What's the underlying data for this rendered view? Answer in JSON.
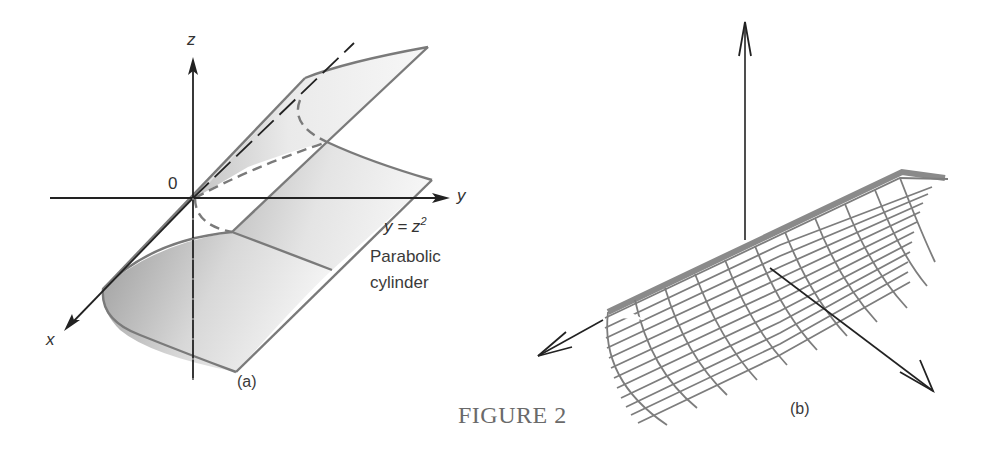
{
  "figure": {
    "title": "FIGURE 2"
  },
  "panel_a": {
    "label": "(a)",
    "axes": {
      "x_label": "x",
      "y_label": "y",
      "z_label": "z",
      "origin_label": "0"
    },
    "equation": {
      "lhs": "y = z",
      "exponent": "2"
    },
    "caption_line1": "Parabolic",
    "caption_line2": "cylinder"
  },
  "panel_b": {
    "label": "(b)"
  },
  "colors": {
    "surface_edge": "#7a7a7a",
    "axis": "#222222",
    "shade_dark": "#9a9a9a",
    "shade_light": "#f2f2f2",
    "title": "#6a6a6a"
  }
}
